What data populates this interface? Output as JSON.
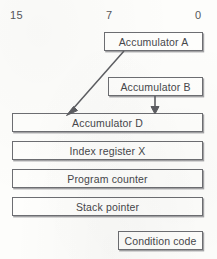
{
  "diagram": {
    "background_color": "#fdfdfb",
    "line_color": "#6d6e72",
    "text_color": "#46474b",
    "bit_labels": [
      {
        "text": "15",
        "x": 10,
        "y": 10
      },
      {
        "text": "7",
        "x": 106,
        "y": 10
      },
      {
        "text": "0",
        "x": 195,
        "y": 10
      }
    ],
    "registers": [
      {
        "name": "accumulator-a",
        "label": "Accumulator A",
        "x": 104,
        "y": 32,
        "width": 99,
        "height": 19
      },
      {
        "name": "accumulator-b",
        "label": "Accumulator B",
        "x": 108,
        "y": 77,
        "width": 95,
        "height": 19
      },
      {
        "name": "accumulator-d",
        "label": "Accumulator D",
        "x": 12,
        "y": 113,
        "width": 191,
        "height": 19
      },
      {
        "name": "index-register-x",
        "label": "Index register X",
        "x": 12,
        "y": 141,
        "width": 191,
        "height": 19
      },
      {
        "name": "program-counter",
        "label": "Program counter",
        "x": 12,
        "y": 169,
        "width": 191,
        "height": 19
      },
      {
        "name": "stack-pointer",
        "label": "Stack pointer",
        "x": 12,
        "y": 197,
        "width": 191,
        "height": 19
      },
      {
        "name": "condition-code",
        "label": "Condition code",
        "x": 118,
        "y": 231,
        "width": 85,
        "height": 19
      }
    ],
    "arrows": [
      {
        "name": "accumulator-a-to-d",
        "from": {
          "x": 124,
          "y": 51
        },
        "to": {
          "x": 67,
          "y": 114
        },
        "style": "diagonal"
      },
      {
        "name": "accumulator-b-to-d",
        "from": {
          "x": 155,
          "y": 96
        },
        "to": {
          "x": 155,
          "y": 113
        },
        "style": "vertical"
      }
    ]
  }
}
